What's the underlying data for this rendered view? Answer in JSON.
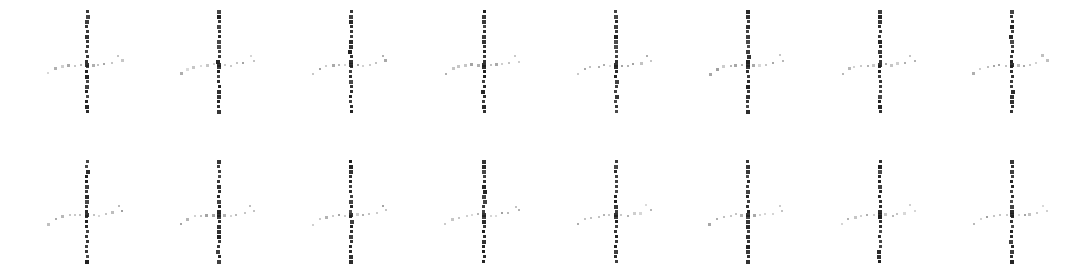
{
  "canvas": {
    "width": 1087,
    "height": 273,
    "background_color": "#ffffff",
    "description": "Grid of dotted cross marks"
  },
  "style": {
    "stem_color": "#1f1f1f",
    "arm_color": "#9a9a9a",
    "arm_color_faint": "#bdbdbd",
    "stem_dot_size": 3,
    "arm_dot_size": 2,
    "stem_dot_pitch": 5,
    "arm_dot_pitch": 6
  },
  "grid": {
    "columns": 8,
    "rows": 2,
    "column_x": [
      87,
      219,
      351,
      484,
      616,
      748,
      880,
      1012
    ],
    "row_center_y": [
      65,
      215
    ],
    "stem_top_offset": -55,
    "stem_bottom_offset": 47,
    "stem_dot_count": 21
  },
  "glyph": {
    "name": "dotted-cross-mark",
    "stem": {
      "orientation": "vertical",
      "weight": "bold",
      "dot_count": 21,
      "length": 102
    },
    "arm_left": {
      "orientation": "horizontal",
      "weight": "light",
      "dots": [
        {
          "dx": -6,
          "dy": 0
        },
        {
          "dx": -12,
          "dy": 0
        },
        {
          "dx": -18,
          "dy": 1
        },
        {
          "dx": -25,
          "dy": 2
        },
        {
          "dx": -31,
          "dy": 4
        },
        {
          "dx": -38,
          "dy": 9
        }
      ]
    },
    "arm_right": {
      "orientation": "horizontal",
      "weight": "light",
      "dots": [
        {
          "dx": 6,
          "dy": 0
        },
        {
          "dx": 12,
          "dy": 0
        },
        {
          "dx": 18,
          "dy": -1
        },
        {
          "dx": 25,
          "dy": -2
        },
        {
          "dx": 31,
          "dy": -9
        },
        {
          "dx": 35,
          "dy": -4
        }
      ]
    },
    "center": {
      "dx": 0,
      "dy": 0
    }
  },
  "marks": [
    {
      "id": "mark-r1-c1",
      "row": 1,
      "col": 1,
      "label": "cross 1"
    },
    {
      "id": "mark-r1-c2",
      "row": 1,
      "col": 2,
      "label": "cross 2"
    },
    {
      "id": "mark-r1-c3",
      "row": 1,
      "col": 3,
      "label": "cross 3"
    },
    {
      "id": "mark-r1-c4",
      "row": 1,
      "col": 4,
      "label": "cross 4"
    },
    {
      "id": "mark-r1-c5",
      "row": 1,
      "col": 5,
      "label": "cross 5"
    },
    {
      "id": "mark-r1-c6",
      "row": 1,
      "col": 6,
      "label": "cross 6"
    },
    {
      "id": "mark-r1-c7",
      "row": 1,
      "col": 7,
      "label": "cross 7"
    },
    {
      "id": "mark-r1-c8",
      "row": 1,
      "col": 8,
      "label": "cross 8"
    },
    {
      "id": "mark-r2-c1",
      "row": 2,
      "col": 1,
      "label": "cross 9"
    },
    {
      "id": "mark-r2-c2",
      "row": 2,
      "col": 2,
      "label": "cross 10"
    },
    {
      "id": "mark-r2-c3",
      "row": 2,
      "col": 3,
      "label": "cross 11"
    },
    {
      "id": "mark-r2-c4",
      "row": 2,
      "col": 4,
      "label": "cross 12"
    },
    {
      "id": "mark-r2-c5",
      "row": 2,
      "col": 5,
      "label": "cross 13"
    },
    {
      "id": "mark-r2-c6",
      "row": 2,
      "col": 6,
      "label": "cross 14"
    },
    {
      "id": "mark-r2-c7",
      "row": 2,
      "col": 7,
      "label": "cross 15"
    },
    {
      "id": "mark-r2-c8",
      "row": 2,
      "col": 8,
      "label": "cross 16"
    }
  ]
}
